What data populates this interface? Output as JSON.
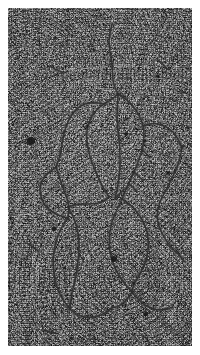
{
  "figure": {
    "name": "electron-micrograph",
    "modality": "transmission electron micrograph",
    "plate": {
      "x": 8,
      "y": 8,
      "width": 184,
      "height": 338,
      "background_color": "#ababab",
      "grain_dark": "#1a1a1a",
      "grain_light": "#f2f2f2"
    },
    "fiber": {
      "color": "#2c2c2c",
      "halo_color": "#4a4a4a",
      "width_px": 1.5
    },
    "topology": {
      "description": "branched duplex DNA with two replication eyes and trailing free arms",
      "fork_count": 4,
      "loop_count": 4
    }
  },
  "fibers": [
    {
      "name": "upper-free-arm",
      "d": "M104,16 C103,22 101,28 101,34 C101,41 103,48 104,55 C105,61 104,66 105,72 C106,78 108,82 110,86"
    },
    {
      "name": "eye1-left-strand",
      "d": "M110,86 C106,90 101,93 96,96 C90,100 85,105 82,112 C79,119 78,127 79,135 C80,144 83,152 86,160 C89,167 92,173 95,179 C97,183 99,186 101,189"
    },
    {
      "name": "eye1-right-strand",
      "d": "M110,86 C115,89 120,92 124,97 C129,103 133,110 135,118 C137,126 136,134 134,142 C132,150 129,157 126,164 C123,171 120,176 118,181 C116,185 115,188 114,191"
    },
    {
      "name": "eye1-center-strand",
      "d": "M110,86 C110,93 109,100 109,107 C109,115 110,123 111,131 C112,139 112,147 112,154 C112,162 111,169 110,176 C109,182 108,187 107,191"
    },
    {
      "name": "left-branch-descender",
      "d": "M101,189 C98,192 94,194 90,195 C85,196 80,196 75,196 C69,196 64,197 60,199"
    },
    {
      "name": "mid-junction-to-left-lobe",
      "d": "M96,96 C91,95 86,94 81,95 C75,96 70,99 66,104 C62,109 59,115 57,122 C55,129 54,136 53,143 C52,149 50,154 48,159"
    },
    {
      "name": "left-small-loop-outer",
      "d": "M48,159 C44,162 40,164 37,168 C34,172 32,177 32,182 C32,188 34,193 37,197 C40,201 44,204 48,206 C52,208 56,209 60,210"
    },
    {
      "name": "left-small-loop-inner",
      "d": "M48,159 C50,165 52,171 54,177 C56,183 58,188 60,193 C61,198 61,204 60,210"
    },
    {
      "name": "left-lobe-descender",
      "d": "M60,210 C57,214 54,218 52,223 C49,229 47,236 46,243 C45,251 45,259 46,266 C47,273 49,280 52,286 C55,292 58,297 62,301"
    },
    {
      "name": "left-lobe-return",
      "d": "M60,199 C63,204 66,210 68,216 C70,223 71,230 71,238 C71,246 70,254 69,262 C68,270 66,277 64,284 C63,291 62,297 62,301"
    },
    {
      "name": "bottom-left-cap",
      "d": "M62,301 C66,305 71,308 76,309 C82,310 88,309 93,307 C98,305 102,302 105,299"
    },
    {
      "name": "eye2-left-strand",
      "d": "M114,191 C112,195 110,199 108,204 C105,210 103,217 102,224 C101,232 101,240 103,248 C105,256 108,263 112,269 C116,275 120,280 124,284"
    },
    {
      "name": "eye2-right-strand",
      "d": "M114,191 C119,194 124,198 128,203 C133,209 137,216 139,224 C141,232 141,240 139,248 C137,256 134,263 130,269 C127,274 124,279 124,284"
    },
    {
      "name": "eye2-bottom-junction",
      "d": "M124,284 C121,289 118,293 114,296 C110,299 107,300 105,299"
    },
    {
      "name": "bottom-right-arm",
      "d": "M124,284 C128,289 132,294 137,297 C142,300 147,302 152,302 C157,302 161,301 165,299"
    },
    {
      "name": "right-upper-arm",
      "d": "M135,118 C140,116 145,115 150,116 C156,117 161,120 165,124 C169,129 172,134 174,140"
    },
    {
      "name": "right-mid-descender",
      "d": "M174,140 C173,147 171,153 169,159 C166,166 163,172 160,178 C157,184 154,189 152,194 C150,199 149,204 149,209"
    },
    {
      "name": "right-lower-arc",
      "d": "M149,209 C150,216 152,222 155,227 C158,233 162,238 166,242 C170,246 174,250 177,254"
    },
    {
      "name": "branch-feather-a",
      "d": "M126,164 C129,167 132,170 135,172"
    },
    {
      "name": "branch-feather-b",
      "d": "M134,142 C137,144 140,147 142,150"
    },
    {
      "name": "branch-feather-c",
      "d": "M121,176 C124,178 127,181 129,184"
    },
    {
      "name": "branch-feather-d",
      "d": "M116,181 C113,184 110,187 108,190"
    },
    {
      "name": "stray-fragment-upper-left",
      "d": "M42,58 C46,61 50,63 54,64"
    },
    {
      "name": "stray-fragment-upper-right",
      "d": "M150,52 C154,55 157,58 159,61"
    },
    {
      "name": "stray-fragment-left-edge",
      "d": "M20,236 C24,238 27,240 30,243"
    },
    {
      "name": "stray-fragment-bottom",
      "d": "M36,322 C40,324 44,325 48,325"
    }
  ],
  "stain_blobs": [
    {
      "name": "stain-blob-major-left",
      "cx": 23,
      "cy": 133,
      "r": 4.1
    },
    {
      "name": "stain-blob-eye2-core",
      "cx": 106,
      "cy": 251,
      "r": 3.0
    },
    {
      "name": "stain-blob-left-loop",
      "cx": 46,
      "cy": 221,
      "r": 2.3
    },
    {
      "name": "stain-blob-eye1-upper",
      "cx": 118,
      "cy": 126,
      "r": 2.1
    },
    {
      "name": "stain-blob-eye1-right",
      "cx": 137,
      "cy": 133,
      "r": 1.8
    },
    {
      "name": "stain-blob-right-field",
      "cx": 160,
      "cy": 165,
      "r": 1.9
    },
    {
      "name": "stain-blob-lower-right",
      "cx": 138,
      "cy": 306,
      "r": 2.2
    },
    {
      "name": "stain-blob-mid-right",
      "cx": 125,
      "cy": 275,
      "r": 1.7
    },
    {
      "name": "stain-blob-upper-right",
      "cx": 149,
      "cy": 68,
      "r": 1.6
    },
    {
      "name": "stain-blob-top-center",
      "cx": 86,
      "cy": 42,
      "r": 1.4
    },
    {
      "name": "stain-blob-left-mid",
      "cx": 79,
      "cy": 118,
      "r": 1.5
    },
    {
      "name": "stain-blob-eye1-low",
      "cx": 103,
      "cy": 180,
      "r": 1.6
    },
    {
      "name": "stain-blob-left-arm",
      "cx": 40,
      "cy": 283,
      "r": 1.5
    },
    {
      "name": "stain-blob-bottom-left",
      "cx": 64,
      "cy": 330,
      "r": 1.4
    },
    {
      "name": "stain-blob-right-lower",
      "cx": 171,
      "cy": 233,
      "r": 1.5
    },
    {
      "name": "stain-blob-top-left",
      "cx": 47,
      "cy": 30,
      "r": 1.3
    },
    {
      "name": "stain-blob-center",
      "cx": 112,
      "cy": 210,
      "r": 1.3
    },
    {
      "name": "stain-blob-right-edge",
      "cx": 180,
      "cy": 120,
      "r": 1.4
    },
    {
      "name": "stain-blob-lower-center",
      "cx": 96,
      "cy": 295,
      "r": 1.3
    },
    {
      "name": "stain-blob-upper-mid",
      "cx": 131,
      "cy": 60,
      "r": 1.2
    }
  ]
}
